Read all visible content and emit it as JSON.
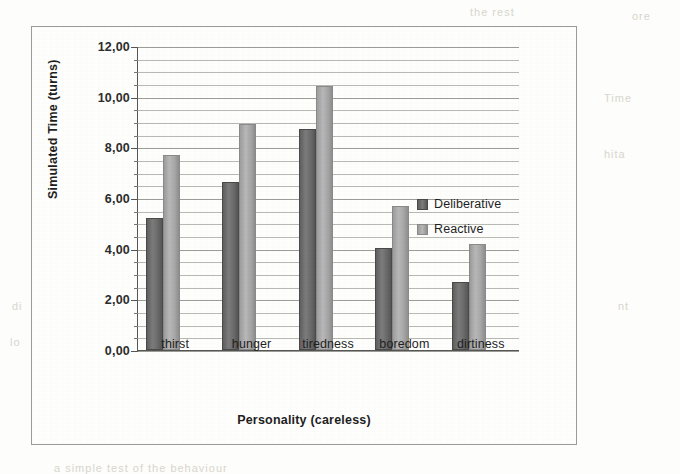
{
  "chart_data": {
    "type": "bar",
    "title": "",
    "xlabel": "Personality (careless)",
    "ylabel": "Simulated Time (turns)",
    "categories": [
      "thirst",
      "hunger",
      "tiredness",
      "boredom",
      "dirtiness"
    ],
    "series": [
      {
        "name": "Deliberative",
        "values": [
          5.15,
          6.55,
          8.65,
          3.95,
          2.6
        ],
        "color": "#6e6e6e"
      },
      {
        "name": "Reactive",
        "values": [
          7.6,
          8.85,
          10.35,
          5.6,
          4.1
        ],
        "color": "#a8a8a8"
      }
    ],
    "ylim": [
      0,
      12
    ],
    "ytick_labels": [
      "0,00",
      "2,00",
      "4,00",
      "6,00",
      "8,00",
      "10,00",
      "12,00"
    ],
    "ytick_values": [
      0,
      2,
      4,
      6,
      8,
      10,
      12
    ],
    "minor_tick_step": 0.5,
    "grid": true,
    "legend_position": "right",
    "decimal_separator": ","
  },
  "legend": {
    "entries": [
      {
        "label": "Deliberative",
        "marker": "legend-swatch-deliberative"
      },
      {
        "label": "Reactive",
        "marker": "legend-swatch-reactive"
      }
    ]
  },
  "scan_artifacts": [
    {
      "text": "the rest",
      "x": 470,
      "y": 6
    },
    {
      "text": "ore",
      "x": 632,
      "y": 10
    },
    {
      "text": "Time",
      "x": 604,
      "y": 92
    },
    {
      "text": "hita",
      "x": 604,
      "y": 148
    },
    {
      "text": "di",
      "x": 12,
      "y": 300
    },
    {
      "text": "lo",
      "x": 10,
      "y": 336
    },
    {
      "text": "nt",
      "x": 618,
      "y": 300
    },
    {
      "text": "a simple test of the behaviour",
      "x": 54,
      "y": 462
    }
  ]
}
